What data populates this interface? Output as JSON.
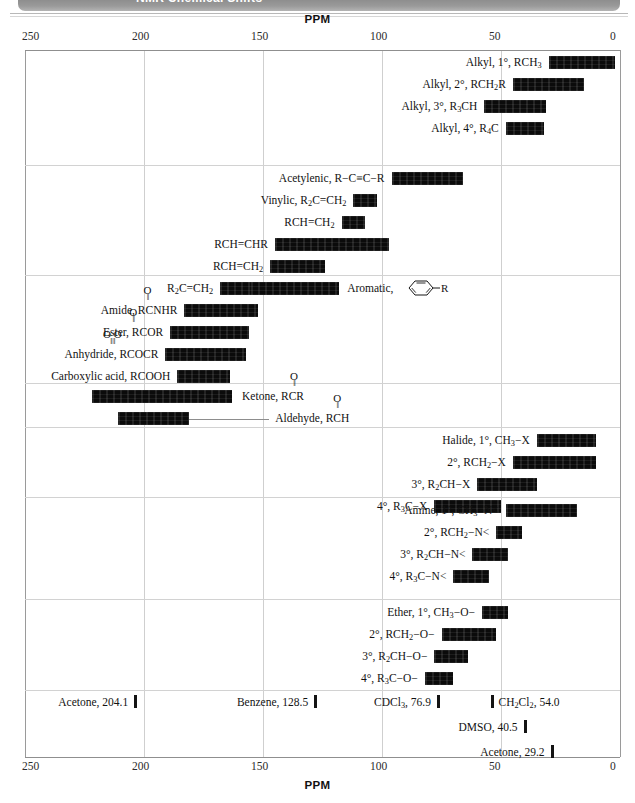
{
  "banner": {
    "title": "NMR Chemical Shifts"
  },
  "axis": {
    "title": "PPM",
    "ticks": [
      250,
      200,
      150,
      100,
      50,
      0
    ],
    "min_ppm": 0,
    "max_ppm": 250,
    "direction": "reversed"
  },
  "chart_data": {
    "type": "bar",
    "title": "PPM",
    "subtitle": "NMR Chemical Shifts",
    "xlabel": "PPM",
    "ylabel": "",
    "xlim": [
      250,
      0
    ],
    "grid": true,
    "legend": null,
    "orientation": "horizontal-range",
    "note": "Each entry is a carbon-13 chemical-shift range bar (from_ppm to to_ppm).",
    "groups": [
      {
        "name": "alkyl",
        "entries": [
          {
            "label": "Alkyl, 1°, RCH3",
            "label_html": "Alkyl, 1&deg;, RCH<sub>3</sub>",
            "from_ppm": 30,
            "to_ppm": 2
          },
          {
            "label": "Alkyl, 2°, RCH2R",
            "label_html": "Alkyl, 2&deg;, RCH<sub>2</sub>R",
            "from_ppm": 45,
            "to_ppm": 15
          },
          {
            "label": "Alkyl, 3°, R3CH",
            "label_html": "Alkyl, 3&deg;, R<sub>3</sub>CH",
            "from_ppm": 57,
            "to_ppm": 31
          },
          {
            "label": "Alkyl, 4°, R4C",
            "label_html": "Alkyl, 4&deg;, R<sub>4</sub>C",
            "from_ppm": 48,
            "to_ppm": 32
          }
        ]
      },
      {
        "name": "unsaturated",
        "entries": [
          {
            "label": "Acetylenic, R−C≡C−R",
            "label_html": "Acetylenic, R&minus;C&equiv;C&minus;R",
            "from_ppm": 96,
            "to_ppm": 66
          },
          {
            "label": "Vinylic, R2C=CH2",
            "label_html": "Vinylic, R<sub>2</sub>C=CH<sub>2</sub>",
            "from_ppm": 112,
            "to_ppm": 102
          },
          {
            "label": "RCH=CH2",
            "label_html": "RCH=CH<sub>2</sub>",
            "from_ppm": 117,
            "to_ppm": 107
          },
          {
            "label": "RCH=CHR",
            "label_html": "RCH=CHR",
            "from_ppm": 145,
            "to_ppm": 97
          },
          {
            "label": "RCH=CH2",
            "label_html": "RCH=CH<sub>2</sub>",
            "from_ppm": 147,
            "to_ppm": 124
          },
          {
            "label": "R2C=CH2",
            "label_html": "R<sub>2</sub>C=CH<sub>2</sub>",
            "from_ppm": 168,
            "to_ppm": 137
          }
        ]
      },
      {
        "name": "aromatic-and-carbonyl",
        "entries": [
          {
            "label": "Aromatic, C6H5−R",
            "label_html": "Aromatic,",
            "from_ppm": 155,
            "to_ppm": 118,
            "icon": "benzene-ring"
          },
          {
            "label": "Amide, RCONHR",
            "label_html": "Amide, RCNHR",
            "carbonyl": "single",
            "from_ppm": 183,
            "to_ppm": 152
          },
          {
            "label": "Ester, RCOOR",
            "label_html": "Ester, RCOR",
            "carbonyl": "single",
            "from_ppm": 189,
            "to_ppm": 156
          },
          {
            "label": "Anhydride, RCOOCR",
            "label_html": "Anhydride, RCOCR",
            "carbonyl": "double",
            "from_ppm": 191,
            "to_ppm": 157
          },
          {
            "label": "Carboxylic acid, RCOOH",
            "label_html": "Carboxylic acid, RCOOH",
            "from_ppm": 186,
            "to_ppm": 164
          }
        ]
      },
      {
        "name": "ketone-aldehyde",
        "entries": [
          {
            "label": "Ketone, RCOR",
            "label_html": "Ketone, RCR",
            "carbonyl": "single",
            "from_ppm": 222,
            "to_ppm": 163
          },
          {
            "label": "Aldehyde, RCHO",
            "label_html": "Aldehyde, RCH",
            "carbonyl": "single",
            "from_ppm": 211,
            "to_ppm": 181,
            "leader": true
          }
        ]
      },
      {
        "name": "halide",
        "entries": [
          {
            "label": "Halide, 1°, CH3−X",
            "label_html": "Halide, 1&deg;, CH<sub>3</sub>&minus;X",
            "from_ppm": 35,
            "to_ppm": 10
          },
          {
            "label": "2°, RCH2−X",
            "label_html": "2&deg;, RCH<sub>2</sub>&minus;X",
            "from_ppm": 45,
            "to_ppm": 10
          },
          {
            "label": "3°, R2CH−X",
            "label_html": "3&deg;, R<sub>2</sub>CH&minus;X",
            "from_ppm": 60,
            "to_ppm": 35
          },
          {
            "label": "4°, R3C−X",
            "label_html": "4&deg;, R<sub>3</sub>C&minus;X",
            "from_ppm": 78,
            "to_ppm": 50
          }
        ]
      },
      {
        "name": "amine",
        "entries": [
          {
            "label": "Amine, 1°, CH3−N<",
            "label_html": "Amine, 1&deg;, CH<sub>3</sub>&minus;N&lt;",
            "from_ppm": 48,
            "to_ppm": 18
          },
          {
            "label": "2°, RCH2−N<",
            "label_html": "2&deg;, RCH<sub>2</sub>&minus;N&lt;",
            "from_ppm": 52,
            "to_ppm": 41
          },
          {
            "label": "3°, R2CH−N<",
            "label_html": "3&deg;, R<sub>2</sub>CH&minus;N&lt;",
            "from_ppm": 62,
            "to_ppm": 47
          },
          {
            "label": "4°, R3C−N<",
            "label_html": "4&deg;, R<sub>3</sub>C&minus;N&lt;",
            "from_ppm": 70,
            "to_ppm": 55
          }
        ]
      },
      {
        "name": "ether-alcohol",
        "entries": [
          {
            "label": "Ether, 1°, CH3−O−",
            "label_html": "Ether, 1&deg;, CH<sub>3</sub>&minus;O&minus;",
            "from_ppm": 58,
            "to_ppm": 47
          },
          {
            "label": "2°, RCH2−O−",
            "label_html": "2&deg;, RCH<sub>2</sub>&minus;O&minus;",
            "from_ppm": 75,
            "to_ppm": 52
          },
          {
            "label": "3°, R2CH−O−",
            "label_html": "3&deg;, R<sub>2</sub>CH&minus;O&minus;",
            "from_ppm": 78,
            "to_ppm": 64
          },
          {
            "label": "4°, R3C−O−",
            "label_html": "4&deg;, R<sub>3</sub>C&minus;O&minus;",
            "from_ppm": 82,
            "to_ppm": 70
          }
        ]
      }
    ],
    "solvent_references": [
      {
        "label": "Acetone, 204.1",
        "label_html": "Acetone, 204.1",
        "ppm": 204.1,
        "tick_side": "right",
        "line": 1
      },
      {
        "label": "Benzene, 128.5",
        "label_html": "Benzene, 128.5",
        "ppm": 128.5,
        "tick_side": "right",
        "line": 1
      },
      {
        "label": "CDCl3, 76.9",
        "label_html": "CDCl<sub>3</sub>, 76.9",
        "ppm": 76.9,
        "tick_side": "right",
        "line": 1
      },
      {
        "label": "CH2Cl2, 54.0",
        "label_html": "CH<sub>2</sub>Cl<sub>2</sub>, 54.0",
        "ppm": 54.0,
        "tick_side": "left",
        "line": 1
      },
      {
        "label": "DMSO, 40.5",
        "label_html": "DMSO, 40.5",
        "ppm": 40.5,
        "tick_side": "right",
        "line": 2
      },
      {
        "label": "Acetone, 29.2",
        "label_html": "Acetone, 29.2",
        "ppm": 29.2,
        "tick_side": "right",
        "line": 3
      }
    ]
  }
}
